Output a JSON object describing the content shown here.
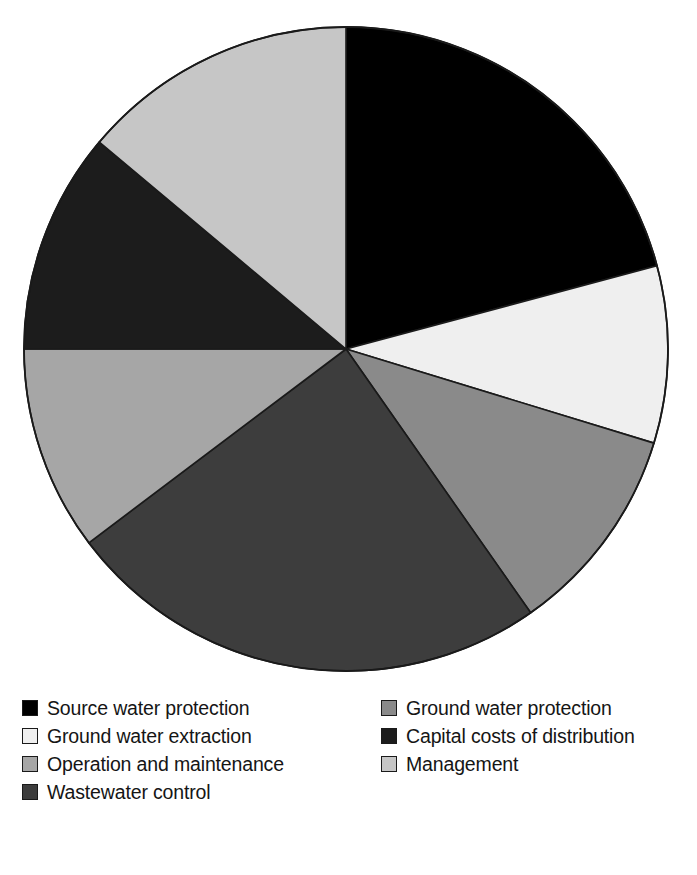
{
  "chart_data": {
    "type": "pie",
    "title": "",
    "subtitle": "",
    "xlabel": "",
    "ylabel": "",
    "grid": false,
    "legend_position": "bottom",
    "legend_columns": 2,
    "start_angle_deg": 0,
    "direction": "clockwise",
    "center": {
      "x": 346,
      "y": 349
    },
    "radius": 322,
    "categories": [
      "Source water protection",
      "Ground water extraction",
      "Ground water protection",
      "Wastewater control",
      "Operation and maintenance",
      "Capital costs of distribution",
      "Management"
    ],
    "values": [
      20.8,
      8.9,
      10.6,
      24.4,
      10.3,
      11.1,
      13.9
    ],
    "value_unit": "percent",
    "angles_deg": [
      75,
      32,
      38,
      88,
      37,
      40,
      50
    ],
    "slice_colors": [
      "#000000",
      "#efefef",
      "#8a8a8a",
      "#3d3d3d",
      "#a6a6a6",
      "#1c1c1c",
      "#c6c6c6"
    ],
    "slices": [
      {
        "label": "Source water protection",
        "value": 20.8,
        "angle_deg": 75,
        "start_deg": 0,
        "end_deg": 75,
        "color": "#000000"
      },
      {
        "label": "Ground water extraction",
        "value": 8.9,
        "angle_deg": 32,
        "start_deg": 75,
        "end_deg": 107,
        "color": "#efefef"
      },
      {
        "label": "Ground water protection",
        "value": 10.6,
        "angle_deg": 38,
        "start_deg": 107,
        "end_deg": 145,
        "color": "#8a8a8a"
      },
      {
        "label": "Wastewater control",
        "value": 24.4,
        "angle_deg": 88,
        "start_deg": 145,
        "end_deg": 233,
        "color": "#3d3d3d"
      },
      {
        "label": "Operation and maintenance",
        "value": 10.3,
        "angle_deg": 37,
        "start_deg": 233,
        "end_deg": 270,
        "color": "#a6a6a6"
      },
      {
        "label": "Capital costs of distribution",
        "value": 11.1,
        "angle_deg": 40,
        "start_deg": 270,
        "end_deg": 310,
        "color": "#1c1c1c"
      },
      {
        "label": "Management",
        "value": 13.9,
        "angle_deg": 50,
        "start_deg": 310,
        "end_deg": 360,
        "color": "#c6c6c6"
      }
    ],
    "stroke_color": "#1a1a1a",
    "background": "#ffffff"
  },
  "legend": {
    "columns": [
      {
        "items": [
          {
            "label": "Source water protection",
            "color": "#000000"
          },
          {
            "label": "Ground water extraction",
            "color": "#efefef"
          },
          {
            "label": "Operation and maintenance",
            "color": "#a6a6a6"
          },
          {
            "label": "Wastewater control",
            "color": "#3d3d3d"
          }
        ]
      },
      {
        "items": [
          {
            "label": "Ground water protection",
            "color": "#8a8a8a"
          },
          {
            "label": "Capital costs of distribution",
            "color": "#1c1c1c"
          },
          {
            "label": "Management",
            "color": "#c6c6c6"
          }
        ]
      }
    ]
  }
}
